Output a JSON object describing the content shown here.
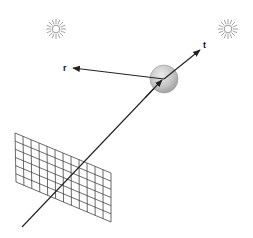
{
  "diagram": {
    "title": "",
    "labels": {
      "reflected": "r",
      "transmitted": "t"
    },
    "colors": {
      "background": "#ffffff",
      "line": "#222222",
      "grid": "#444444",
      "sphere_light": "#e6e6e6",
      "sphere_dark": "#a8a8a8",
      "sun": "#9a9a9a"
    },
    "elements": {
      "light_sources": [
        {
          "name": "light-left",
          "cx": 56,
          "cy": 29,
          "r": 10,
          "rays": 16
        },
        {
          "name": "light-right",
          "cx": 228,
          "cy": 29,
          "r": 10,
          "rays": 16
        }
      ],
      "sphere": {
        "cx": 164,
        "cy": 79,
        "r": 14
      },
      "image_plane": {
        "corners": [
          [
            15,
            133
          ],
          [
            111,
            173
          ],
          [
            111,
            222
          ],
          [
            16,
            182
          ]
        ],
        "columns": 12,
        "rows": 6
      },
      "rays": [
        {
          "name": "primary-ray",
          "from": [
            22,
            227
          ],
          "to": [
            162,
            80
          ]
        },
        {
          "name": "reflected-ray",
          "from": [
            164,
            79
          ],
          "to": [
            73,
            68
          ]
        },
        {
          "name": "transmitted-ray",
          "from": [
            164,
            79
          ],
          "to": [
            200,
            50
          ]
        }
      ],
      "label_positions": {
        "reflected": [
          63,
          71
        ],
        "transmitted": [
          203,
          48
        ]
      }
    }
  }
}
